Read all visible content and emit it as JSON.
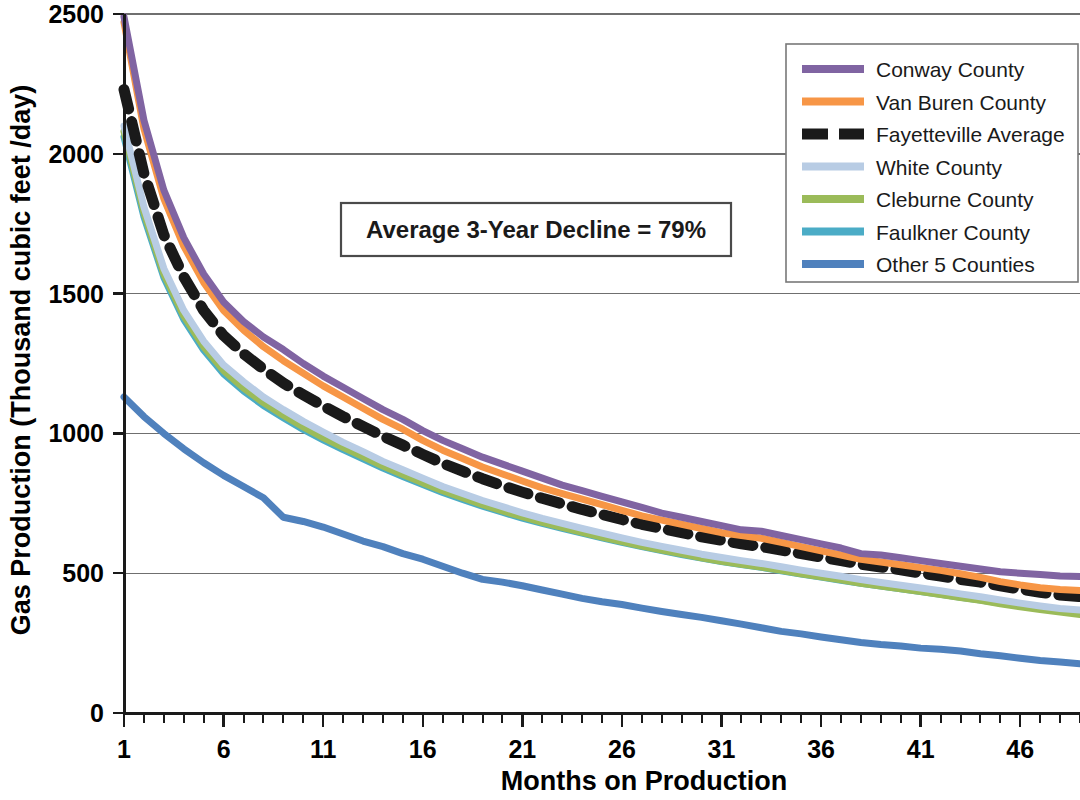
{
  "chart_data": {
    "type": "line",
    "title": "",
    "xlabel": "Months on Production",
    "ylabel": "Gas Production (Thousand cubic feet /day)",
    "xlim": [
      1,
      49
    ],
    "ylim": [
      0,
      2500
    ],
    "xticks": [
      1,
      6,
      11,
      16,
      21,
      26,
      31,
      36,
      41,
      46
    ],
    "xtick_labels": [
      "1",
      "6",
      "11",
      "16",
      "21",
      "26",
      "31",
      "36",
      "41",
      "46"
    ],
    "yticks": [
      0,
      500,
      1000,
      1500,
      2000,
      2500
    ],
    "ytick_labels": [
      "0",
      "500",
      "1000",
      "1500",
      "2000",
      "2500"
    ],
    "grid": "horizontal",
    "legend_position": "top-right",
    "annotations": [
      {
        "text": "Average 3-Year Decline = 79%",
        "x": 11.5,
        "y": 1790,
        "boxed": true
      }
    ],
    "x": [
      1,
      2,
      3,
      4,
      5,
      6,
      7,
      8,
      9,
      10,
      11,
      12,
      13,
      14,
      15,
      16,
      17,
      18,
      19,
      20,
      21,
      22,
      23,
      24,
      25,
      26,
      27,
      28,
      29,
      30,
      31,
      32,
      33,
      34,
      35,
      36,
      37,
      38,
      39,
      40,
      41,
      42,
      43,
      44,
      45,
      46,
      47,
      48,
      49
    ],
    "series": [
      {
        "name": "Conway County",
        "color": "#8064A2",
        "style": "solid",
        "values": [
          2490,
          2120,
          1870,
          1700,
          1570,
          1470,
          1400,
          1345,
          1300,
          1250,
          1205,
          1165,
          1125,
          1085,
          1050,
          1010,
          975,
          945,
          915,
          890,
          865,
          840,
          815,
          795,
          775,
          755,
          735,
          715,
          700,
          685,
          670,
          655,
          650,
          635,
          620,
          605,
          590,
          570,
          565,
          555,
          545,
          535,
          525,
          515,
          505,
          500,
          495,
          490,
          488
        ]
      },
      {
        "name": "Van Buren County",
        "color": "#F79646",
        "style": "solid",
        "values": [
          2470,
          2090,
          1840,
          1670,
          1540,
          1440,
          1370,
          1310,
          1260,
          1215,
          1170,
          1130,
          1090,
          1050,
          1015,
          975,
          940,
          910,
          880,
          855,
          830,
          805,
          785,
          765,
          745,
          725,
          705,
          690,
          675,
          660,
          645,
          635,
          625,
          610,
          595,
          580,
          565,
          550,
          540,
          530,
          520,
          510,
          498,
          485,
          470,
          458,
          448,
          442,
          438
        ]
      },
      {
        "name": "Fayetteville Average",
        "color": "#1a1a1a",
        "style": "dashed",
        "values": [
          2230,
          1930,
          1710,
          1560,
          1440,
          1350,
          1285,
          1230,
          1180,
          1138,
          1098,
          1060,
          1025,
          990,
          958,
          925,
          893,
          865,
          838,
          813,
          790,
          768,
          748,
          728,
          710,
          692,
          675,
          660,
          645,
          630,
          618,
          605,
          595,
          583,
          570,
          558,
          545,
          532,
          522,
          512,
          500,
          490,
          478,
          468,
          455,
          443,
          432,
          422,
          416
        ]
      },
      {
        "name": "White County",
        "color": "#B8CCE4",
        "style": "solid",
        "values": [
          2100,
          1810,
          1590,
          1440,
          1330,
          1245,
          1185,
          1130,
          1085,
          1043,
          1005,
          968,
          935,
          900,
          870,
          840,
          810,
          785,
          760,
          738,
          716,
          696,
          678,
          660,
          643,
          626,
          610,
          596,
          582,
          568,
          556,
          545,
          535,
          523,
          511,
          500,
          489,
          477,
          467,
          457,
          447,
          437,
          426,
          416,
          404,
          393,
          383,
          374,
          368
        ]
      },
      {
        "name": "Cleburne County",
        "color": "#9BBB59",
        "style": "solid",
        "values": [
          2080,
          1790,
          1570,
          1420,
          1310,
          1225,
          1163,
          1110,
          1065,
          1023,
          985,
          950,
          917,
          883,
          853,
          823,
          795,
          770,
          745,
          723,
          702,
          682,
          664,
          646,
          629,
          613,
          597,
          583,
          569,
          555,
          543,
          532,
          522,
          510,
          498,
          487,
          476,
          464,
          454,
          444,
          434,
          424,
          413,
          403,
          391,
          380,
          370,
          361,
          352
        ]
      },
      {
        "name": "Faulkner County",
        "color": "#4BACC6",
        "style": "solid",
        "values": [
          2060,
          1775,
          1558,
          1408,
          1298,
          1213,
          1152,
          1100,
          1056,
          1014,
          977,
          942,
          909,
          876,
          846,
          817,
          789,
          764,
          740,
          718,
          697,
          678,
          660,
          643,
          626,
          610,
          595,
          581,
          567,
          554,
          542,
          531,
          521,
          509,
          497,
          486,
          475,
          464,
          454,
          444,
          434,
          425,
          414,
          404,
          393,
          383,
          374,
          366,
          360
        ]
      },
      {
        "name": "Other 5 Counties",
        "color": "#4F81BD",
        "style": "solid",
        "values": [
          1130,
          1060,
          1000,
          945,
          895,
          850,
          810,
          770,
          700,
          685,
          665,
          640,
          615,
          595,
          570,
          550,
          525,
          500,
          478,
          468,
          455,
          440,
          425,
          410,
          398,
          388,
          375,
          363,
          352,
          342,
          330,
          318,
          305,
          292,
          283,
          272,
          262,
          252,
          245,
          240,
          232,
          228,
          222,
          212,
          205,
          196,
          188,
          182,
          176
        ]
      }
    ]
  },
  "legend": {
    "items": [
      {
        "label": "Conway County",
        "color": "#8064A2",
        "style": "solid"
      },
      {
        "label": "Van Buren County",
        "color": "#F79646",
        "style": "solid"
      },
      {
        "label": "Fayetteville Average",
        "color": "#1a1a1a",
        "style": "dashed"
      },
      {
        "label": "White County",
        "color": "#B8CCE4",
        "style": "solid"
      },
      {
        "label": "Cleburne County",
        "color": "#9BBB59",
        "style": "solid"
      },
      {
        "label": "Faulkner County",
        "color": "#4BACC6",
        "style": "solid"
      },
      {
        "label": "Other 5 Counties",
        "color": "#4F81BD",
        "style": "solid"
      }
    ]
  },
  "colors": {
    "axis": "#1a1a1a",
    "grid": "#6f6f6f",
    "background": "#ffffff",
    "annotation_border": "#4a4a4a",
    "legend_border": "#787878"
  }
}
